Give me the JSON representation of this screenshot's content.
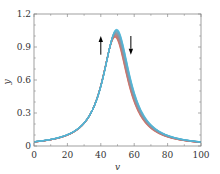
{
  "chart_data": {
    "type": "line",
    "title": "",
    "xlabel": "v",
    "ylabel": "y",
    "xlim": [
      0,
      100
    ],
    "ylim": [
      0,
      1.2
    ],
    "xticks": [
      0,
      20,
      40,
      60,
      80,
      100
    ],
    "yticks": [
      0,
      0.3,
      0.6,
      0.9,
      1.2
    ],
    "ytick_labels": [
      "0",
      "0.3",
      "0.6",
      "0.9",
      "1.2"
    ],
    "grid": false,
    "legend": null,
    "series": [
      {
        "name": "curve-red",
        "color": "#e0695a",
        "center": 48.5,
        "width": 9.5,
        "peak": 0.99
      },
      {
        "name": "curve-mid",
        "color": "#8a8a8a",
        "center": 49.0,
        "width": 9.6,
        "peak": 1.02
      },
      {
        "name": "curve-cyan",
        "color": "#4fb6d8",
        "center": 49.5,
        "width": 9.7,
        "peak": 1.06
      }
    ],
    "sample_points": {
      "x": [
        0,
        10,
        20,
        30,
        40,
        45,
        49,
        55,
        60,
        70,
        80,
        90,
        100
      ],
      "y": [
        0.036,
        0.057,
        0.097,
        0.2,
        0.5,
        0.85,
        1.0,
        0.75,
        0.45,
        0.17,
        0.09,
        0.05,
        0.035
      ]
    },
    "annotations": [
      {
        "type": "arrow",
        "direction": "up",
        "x": 40,
        "y_from": 0.83,
        "y_to": 1.0,
        "color": "#000000"
      },
      {
        "type": "arrow",
        "direction": "down",
        "x": 58,
        "y_from": 1.0,
        "y_to": 0.83,
        "color": "#000000"
      }
    ]
  }
}
